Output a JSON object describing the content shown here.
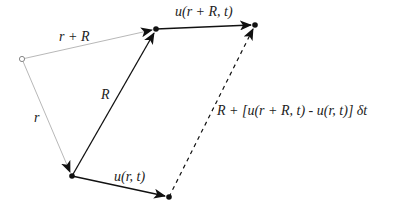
{
  "diagram": {
    "type": "vector-displacement-diagram",
    "points": {
      "origin": {
        "x": 22,
        "y": 59,
        "style": "open-circle"
      },
      "r_tip": {
        "x": 72,
        "y": 176,
        "style": "filled-dot"
      },
      "rR_tip": {
        "x": 156,
        "y": 29,
        "style": "filled-dot"
      },
      "u_rR_tip": {
        "x": 255,
        "y": 25,
        "style": "filled-dot"
      },
      "u_r_tip": {
        "x": 169,
        "y": 197,
        "style": "filled-dot"
      }
    },
    "vectors": [
      {
        "id": "r",
        "from": "origin",
        "to": "r_tip",
        "style": "thin-gray",
        "label": "r"
      },
      {
        "id": "r_plus_R",
        "from": "origin",
        "to": "rR_tip",
        "style": "thin-gray",
        "label": "r + R"
      },
      {
        "id": "R",
        "from": "r_tip",
        "to": "rR_tip",
        "style": "solid-black",
        "label": "R"
      },
      {
        "id": "u_r",
        "from": "r_tip",
        "to": "u_r_tip",
        "style": "solid-black",
        "label": "u(r, t)"
      },
      {
        "id": "u_rR",
        "from": "rR_tip",
        "to": "u_rR_tip",
        "style": "solid-black",
        "label": "u(r + R, t)"
      },
      {
        "id": "R_new",
        "from": "u_r_tip",
        "to": "u_rR_tip",
        "style": "dashed-black",
        "label": "R + [u(r + R, t) - u(r, t)] δt"
      }
    ],
    "labels": {
      "r": "r",
      "r_plus_R": "r + R",
      "R": "R",
      "u_r": "u(r, t)",
      "u_rR": "u(r + R, t)",
      "R_new": "R + [u(r + R, t) - u(r, t)] δt"
    },
    "colors": {
      "solid": "#111111",
      "thin": "#b8b8b8",
      "text": "#222222",
      "background": "#ffffff"
    }
  }
}
